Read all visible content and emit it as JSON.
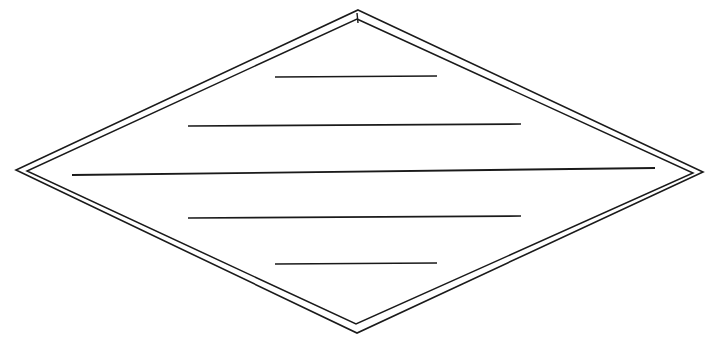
{
  "document": {
    "title": "Diamond Ruled Label Template",
    "background_color": "#ffffff",
    "ink_color": "#1a1a1a",
    "width": 708,
    "height": 346,
    "description": "Hand-drawn scanned diamond (rhombus) outlined twice with five blank horizontal ruled writing lines inside"
  },
  "figure": {
    "name": "double-outlined-diamond",
    "shape_type": "rhombus",
    "stroke_color": "#1a1a1a",
    "fill": "none",
    "outer_outline": {
      "name": "outer-diamond-outline",
      "stroke_width": 1.6,
      "points": "358,10 703,172 357,333 16,170",
      "vertices": {
        "top": [
          358,
          10
        ],
        "right": [
          703,
          172
        ],
        "bottom": [
          357,
          333
        ],
        "left": [
          16,
          170
        ]
      }
    },
    "inner_outline": {
      "name": "inner-diamond-outline",
      "stroke_width": 1.5,
      "points": "357,19 693,173 356,324 27,171",
      "vertices": {
        "top": [
          357,
          19
        ],
        "right": [
          693,
          173
        ],
        "bottom": [
          356,
          324
        ],
        "left": [
          27,
          171
        ]
      }
    },
    "apex_tick": {
      "name": "apex-tick-mark",
      "stroke_width": 1.4,
      "x1": 357,
      "y1": 13,
      "x2": 358,
      "y2": 23
    },
    "rule_lines": [
      {
        "id": 1,
        "name": "rule-line-1",
        "x1": 275,
        "y1": 77,
        "x2": 437,
        "y2": 76,
        "length": 162,
        "stroke_width": 1.7
      },
      {
        "id": 2,
        "name": "rule-line-2",
        "x1": 188,
        "y1": 126,
        "x2": 521,
        "y2": 124,
        "length": 333,
        "stroke_width": 1.7
      },
      {
        "id": 3,
        "name": "rule-line-3",
        "x1": 72,
        "y1": 175,
        "x2": 655,
        "y2": 168,
        "length": 583,
        "stroke_width": 1.8
      },
      {
        "id": 4,
        "name": "rule-line-4",
        "x1": 188,
        "y1": 218,
        "x2": 521,
        "y2": 216,
        "length": 333,
        "stroke_width": 1.7
      },
      {
        "id": 5,
        "name": "rule-line-5",
        "x1": 275,
        "y1": 264,
        "x2": 437,
        "y2": 263,
        "length": 162,
        "stroke_width": 1.7
      }
    ],
    "rule_line_count": 5,
    "text_content": ""
  }
}
